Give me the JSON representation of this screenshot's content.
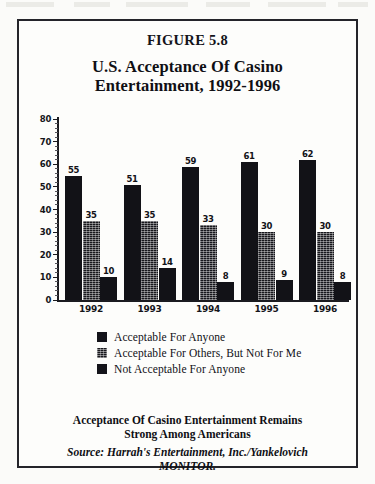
{
  "figure": {
    "number": "FIGURE 5.8",
    "title_line1": "U.S. Acceptance Of Casino",
    "title_line2": "Entertainment, 1992-1996"
  },
  "caption": {
    "line1": "Acceptance Of Casino Entertainment Remains",
    "line2": "Strong Among Americans"
  },
  "source": {
    "line1": "Source: Harrah's Entertainment, Inc./Yankelovich",
    "line2": "MONITOR."
  },
  "colors": {
    "ink": "#121217",
    "frame": "#24242a",
    "paper": "#fdfdfb"
  },
  "chart_data": {
    "type": "bar",
    "title": "U.S. Acceptance Of Casino Entertainment, 1992-1996",
    "xlabel": "",
    "ylabel": "",
    "ylim": [
      0,
      80
    ],
    "yticks": [
      0,
      10,
      20,
      30,
      40,
      50,
      60,
      70,
      80
    ],
    "grid": false,
    "legend_position": "below",
    "categories": [
      "1992",
      "1993",
      "1994",
      "1995",
      "1996"
    ],
    "series": [
      {
        "name": "Acceptable For Anyone",
        "values": [
          55,
          51,
          59,
          61,
          62
        ]
      },
      {
        "name": "Acceptable For Others, But Not For Me",
        "values": [
          35,
          35,
          33,
          30,
          30
        ]
      },
      {
        "name": "Not Acceptable For Anyone",
        "values": [
          10,
          14,
          8,
          9,
          8
        ]
      }
    ]
  }
}
